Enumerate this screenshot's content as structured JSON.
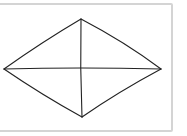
{
  "diagram": {
    "type": "diamond-with-diagonals",
    "stroke_color": "#222222",
    "frame_border_color": "#d4d4d4",
    "vertices": {
      "top": [
        81,
        19
      ],
      "right": [
        161,
        69
      ],
      "bottom": [
        82,
        117
      ],
      "left": [
        4,
        69
      ]
    },
    "center": [
      81,
      68
    ]
  }
}
